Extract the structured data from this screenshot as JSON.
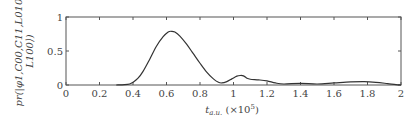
{
  "chart_data": {
    "type": "line",
    "title": "",
    "xlabel": "t_a.u. (×10^5)",
    "xlabel_main": "t",
    "xlabel_sub": "a.u.",
    "xlabel_suffix": " (×10",
    "xlabel_exp": "5",
    "xlabel_close": ")",
    "ylabel_line1": "pr(|φ1,C00,C11,L010,",
    "ylabel_line2": "L100⟩)",
    "xlim": [
      0,
      2
    ],
    "ylim": [
      0,
      1
    ],
    "xticks": [
      "0",
      "0.2",
      "0.4",
      "0.6",
      "0.8",
      "1",
      "1.2",
      "1.4",
      "1.6",
      "1.8",
      "2"
    ],
    "yticks": [
      "0",
      "0.5",
      "1"
    ],
    "grid": false,
    "legend": null,
    "series": [
      {
        "name": "pr",
        "x": [
          0.3,
          0.35,
          0.38,
          0.4,
          0.43,
          0.46,
          0.5,
          0.54,
          0.58,
          0.61,
          0.63,
          0.65,
          0.68,
          0.72,
          0.76,
          0.8,
          0.84,
          0.88,
          0.91,
          0.93,
          0.96,
          0.99,
          1.02,
          1.04,
          1.06,
          1.08,
          1.1,
          1.15,
          1.2,
          1.25,
          1.3,
          1.4,
          1.5,
          1.6,
          1.7,
          1.78,
          1.85,
          1.92,
          1.97,
          2.0
        ],
        "values": [
          0.0,
          0.005,
          0.015,
          0.04,
          0.1,
          0.2,
          0.38,
          0.57,
          0.71,
          0.78,
          0.79,
          0.78,
          0.72,
          0.6,
          0.46,
          0.32,
          0.19,
          0.09,
          0.04,
          0.03,
          0.05,
          0.09,
          0.13,
          0.14,
          0.135,
          0.1,
          0.085,
          0.075,
          0.06,
          0.03,
          0.015,
          0.025,
          0.015,
          0.03,
          0.045,
          0.05,
          0.04,
          0.02,
          0.005,
          0.0
        ]
      }
    ]
  }
}
